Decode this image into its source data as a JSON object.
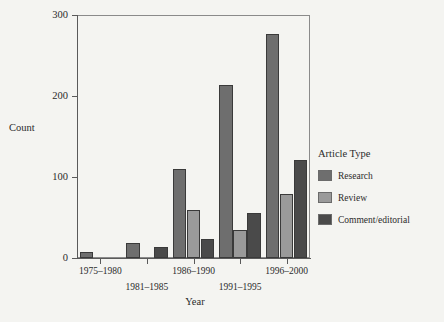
{
  "chart_data": {
    "type": "bar",
    "title": "",
    "subtitle": "",
    "xlabel": "Year",
    "ylabel": "Count",
    "categories": [
      "1975–1980",
      "1981–1985",
      "1986–1990",
      "1991–1995",
      "1996–2000"
    ],
    "series": [
      {
        "name": "Research",
        "color": "#6e6e6e",
        "values": [
          8,
          19,
          110,
          214,
          277
        ]
      },
      {
        "name": "Review",
        "color": "#9a9a9a",
        "values": [
          0,
          1,
          59,
          35,
          79
        ]
      },
      {
        "name": "Comment/editorial",
        "color": "#4a4a4a",
        "values": [
          0,
          13,
          23,
          55,
          121
        ]
      }
    ],
    "ylim": [
      0,
      300
    ],
    "yticks": [
      0,
      100,
      200,
      300
    ],
    "ytick_labels": [
      "0",
      "100",
      "200",
      "300"
    ],
    "grid": false,
    "legend_position": "right",
    "legend_title": "Article Type",
    "xtick_stagger": [
      0,
      1,
      0,
      1,
      0
    ]
  },
  "legend": {
    "title": "Article Type",
    "entries": [
      {
        "label": "Research",
        "color": "#6e6e6e"
      },
      {
        "label": "Review",
        "color": "#9a9a9a"
      },
      {
        "label": "Comment/editorial",
        "color": "#4a4a4a"
      }
    ]
  },
  "axes": {
    "y_title": "Count",
    "x_title": "Year"
  }
}
